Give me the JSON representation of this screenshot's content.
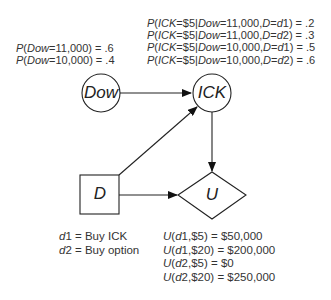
{
  "nodes": {
    "dow": {
      "label": "Dow",
      "shape": "circle"
    },
    "ick": {
      "label": "ICK",
      "shape": "circle"
    },
    "d": {
      "label": "D",
      "shape": "square"
    },
    "u": {
      "label": "U",
      "shape": "diamond"
    }
  },
  "edges": [
    {
      "from": "Dow",
      "to": "ICK"
    },
    {
      "from": "D",
      "to": "ICK"
    },
    {
      "from": "ICK",
      "to": "U"
    },
    {
      "from": "D",
      "to": "U"
    }
  ],
  "dow_probabilities": [
    {
      "var": "Dow",
      "value": "11,000",
      "prob": ".6"
    },
    {
      "var": "Dow",
      "value": "10,000",
      "prob": ".4"
    }
  ],
  "ick_probabilities": [
    {
      "ick": "$5",
      "dow": "11,000",
      "d": "d",
      "dnum": "1",
      "prob": ".2"
    },
    {
      "ick": "$5",
      "dow": "11,000",
      "d": "d",
      "dnum": "2",
      "prob": ".3"
    },
    {
      "ick": "$5",
      "dow": "10,000",
      "d": "d",
      "dnum": "1",
      "prob": ".5"
    },
    {
      "ick": "$5",
      "dow": "10,000",
      "d": "d",
      "dnum": "2",
      "prob": ".6"
    }
  ],
  "decisions": [
    {
      "d": "d",
      "num": "1",
      "label": "Buy ICK"
    },
    {
      "d": "d",
      "num": "2",
      "label": "Buy option"
    }
  ],
  "utilities": [
    {
      "d": "d",
      "num": "1",
      "price": "$5",
      "value": "$50,000"
    },
    {
      "d": "d",
      "num": "1",
      "price": "$20",
      "value": "$200,000"
    },
    {
      "d": "d",
      "num": "2",
      "price": "$5",
      "value": "$0"
    },
    {
      "d": "d",
      "num": "2",
      "price": "$20",
      "value": "$250,000"
    }
  ],
  "static": {
    "P": "P",
    "U": "U",
    "ICK": "ICK",
    "Dow": "Dow",
    "D": "D",
    "eq": "=",
    "sep": "|",
    "comma": ","
  }
}
